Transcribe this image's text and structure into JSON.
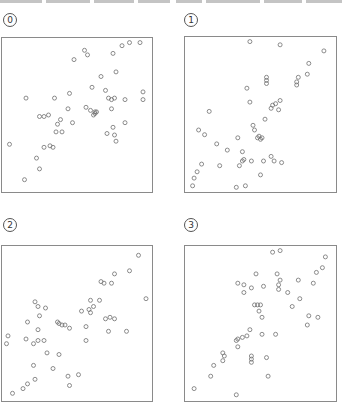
{
  "figure": {
    "panels": [
      {
        "label": "0"
      },
      {
        "label": "1"
      },
      {
        "label": "2"
      },
      {
        "label": "3"
      }
    ]
  },
  "chart_data": [
    {
      "type": "scatter",
      "title": "0",
      "xlabel": "",
      "ylabel": "",
      "grid": false,
      "axis_range_note": "normalized panel coordinates 0-100 (y: 0 = top)",
      "points": [
        [
          5,
          69
        ],
        [
          15,
          92
        ],
        [
          25,
          85
        ],
        [
          23,
          78
        ],
        [
          16,
          39
        ],
        [
          35,
          39
        ],
        [
          25,
          51
        ],
        [
          28,
          51
        ],
        [
          31,
          50
        ],
        [
          28,
          71
        ],
        [
          32,
          70
        ],
        [
          34,
          71
        ],
        [
          36,
          61
        ],
        [
          37,
          56
        ],
        [
          39,
          53
        ],
        [
          40,
          61
        ],
        [
          45,
          36
        ],
        [
          44,
          46
        ],
        [
          47,
          55
        ],
        [
          55,
          8
        ],
        [
          48,
          14
        ],
        [
          57,
          11
        ],
        [
          56,
          45
        ],
        [
          59,
          47
        ],
        [
          62,
          48
        ],
        [
          62,
          49
        ],
        [
          61,
          50
        ],
        [
          63,
          48
        ],
        [
          66,
          25
        ],
        [
          60,
          32
        ],
        [
          69,
          34
        ],
        [
          71,
          39
        ],
        [
          73,
          40
        ],
        [
          75,
          39
        ],
        [
          73,
          46
        ],
        [
          74,
          58
        ],
        [
          70,
          62
        ],
        [
          75,
          63
        ],
        [
          76,
          67
        ],
        [
          76,
          22
        ],
        [
          82,
          55
        ],
        [
          82,
          40
        ],
        [
          74,
          10
        ],
        [
          80,
          5
        ],
        [
          85,
          3
        ],
        [
          92,
          3
        ],
        [
          94,
          40
        ],
        [
          94,
          35
        ]
      ]
    },
    {
      "type": "scatter",
      "title": "1",
      "xlabel": "",
      "ylabel": "",
      "grid": false,
      "axis_range_note": "normalized panel coordinates 0-100 (y: 0 = top)",
      "points": [
        [
          63,
          5
        ],
        [
          92,
          9
        ],
        [
          82,
          17
        ],
        [
          81,
          24
        ],
        [
          75,
          26
        ],
        [
          74,
          29
        ],
        [
          74,
          31
        ],
        [
          54,
          26
        ],
        [
          54,
          28
        ],
        [
          54,
          30
        ],
        [
          41,
          33
        ],
        [
          43,
          42
        ],
        [
          63,
          41
        ],
        [
          58,
          44
        ],
        [
          60,
          43
        ],
        [
          57,
          46
        ],
        [
          45,
          57
        ],
        [
          62,
          47
        ],
        [
          53,
          53
        ],
        [
          16,
          48
        ],
        [
          46,
          60
        ],
        [
          49,
          64
        ],
        [
          48,
          65
        ],
        [
          50,
          66
        ],
        [
          51,
          65
        ],
        [
          9,
          60
        ],
        [
          13,
          63
        ],
        [
          35,
          65
        ],
        [
          21,
          69
        ],
        [
          28,
          73
        ],
        [
          38,
          74
        ],
        [
          39,
          79
        ],
        [
          38,
          80
        ],
        [
          36,
          83
        ],
        [
          44,
          80
        ],
        [
          52,
          80
        ],
        [
          57,
          77
        ],
        [
          59,
          80
        ],
        [
          64,
          81
        ],
        [
          50,
          89
        ],
        [
          23,
          83
        ],
        [
          11,
          82
        ],
        [
          8,
          87
        ],
        [
          6,
          91
        ],
        [
          5,
          96
        ],
        [
          34,
          97
        ],
        [
          40,
          96
        ],
        [
          43,
          3
        ]
      ]
    },
    {
      "type": "scatter",
      "title": "2",
      "xlabel": "",
      "ylabel": "",
      "grid": false,
      "axis_range_note": "normalized panel coordinates 0-100 (y: 0 = top)",
      "points": [
        [
          91,
          6
        ],
        [
          85,
          16
        ],
        [
          75,
          18
        ],
        [
          66,
          23
        ],
        [
          68,
          24
        ],
        [
          73,
          24
        ],
        [
          59,
          35
        ],
        [
          65,
          35
        ],
        [
          61,
          39
        ],
        [
          58,
          41
        ],
        [
          59,
          43
        ],
        [
          53,
          42
        ],
        [
          69,
          47
        ],
        [
          72,
          46
        ],
        [
          75,
          47
        ],
        [
          56,
          52
        ],
        [
          71,
          55
        ],
        [
          83,
          55
        ],
        [
          96,
          34
        ],
        [
          56,
          61
        ],
        [
          22,
          36
        ],
        [
          24,
          39
        ],
        [
          29,
          40
        ],
        [
          25,
          45
        ],
        [
          17,
          49
        ],
        [
          24,
          54
        ],
        [
          37,
          49
        ],
        [
          38,
          50
        ],
        [
          40,
          51
        ],
        [
          42,
          51
        ],
        [
          45,
          53
        ],
        [
          4,
          58
        ],
        [
          3,
          63
        ],
        [
          16,
          60
        ],
        [
          21,
          63
        ],
        [
          24,
          61
        ],
        [
          28,
          61
        ],
        [
          30,
          69
        ],
        [
          38,
          70
        ],
        [
          21,
          77
        ],
        [
          34,
          79
        ],
        [
          44,
          84
        ],
        [
          51,
          83
        ],
        [
          45,
          90
        ],
        [
          22,
          86
        ],
        [
          17,
          89
        ],
        [
          14,
          92
        ],
        [
          7,
          95
        ]
      ]
    },
    {
      "type": "scatter",
      "title": "3",
      "xlabel": "",
      "ylabel": "",
      "grid": false,
      "axis_range_note": "normalized panel coordinates 0-100 (y: 0 = top)",
      "points": [
        [
          58,
          4
        ],
        [
          63,
          3
        ],
        [
          93,
          7
        ],
        [
          91,
          14
        ],
        [
          87,
          17
        ],
        [
          85,
          24
        ],
        [
          75,
          22
        ],
        [
          61,
          18
        ],
        [
          63,
          22
        ],
        [
          62,
          25
        ],
        [
          62,
          28
        ],
        [
          68,
          30
        ],
        [
          76,
          34
        ],
        [
          71,
          39
        ],
        [
          47,
          18
        ],
        [
          35,
          24
        ],
        [
          39,
          25
        ],
        [
          44,
          27
        ],
        [
          52,
          26
        ],
        [
          39,
          30
        ],
        [
          46,
          38
        ],
        [
          48,
          38
        ],
        [
          50,
          38
        ],
        [
          49,
          42
        ],
        [
          51,
          46
        ],
        [
          82,
          45
        ],
        [
          88,
          46
        ],
        [
          81,
          51
        ],
        [
          60,
          57
        ],
        [
          51,
          57
        ],
        [
          43,
          54
        ],
        [
          41,
          58
        ],
        [
          38,
          59
        ],
        [
          35,
          60
        ],
        [
          34,
          61
        ],
        [
          35,
          65
        ],
        [
          25,
          69
        ],
        [
          26,
          71
        ],
        [
          25,
          74
        ],
        [
          19,
          77
        ],
        [
          44,
          71
        ],
        [
          44,
          73
        ],
        [
          44,
          75
        ],
        [
          54,
          72
        ],
        [
          17,
          84
        ],
        [
          55,
          84
        ],
        [
          6,
          92
        ],
        [
          34,
          96
        ]
      ]
    }
  ]
}
